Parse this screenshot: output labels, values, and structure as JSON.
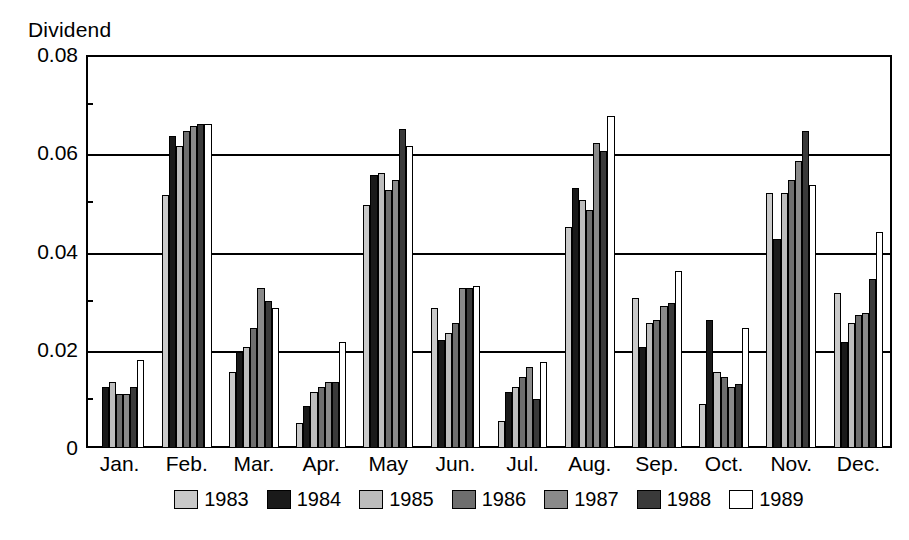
{
  "chart_data": {
    "type": "bar",
    "title": "",
    "ylabel": "Dividend",
    "xlabel": "",
    "ylim": [
      0,
      0.08
    ],
    "ytick_labels": [
      "0",
      "0.02",
      "0.04",
      "0.06",
      "0.08"
    ],
    "ytick_values": [
      0,
      0.02,
      0.04,
      0.06,
      0.08
    ],
    "yminor_values": [
      0.01,
      0.03,
      0.05,
      0.07
    ],
    "grid": true,
    "legend_position": "bottom",
    "categories": [
      "Jan.",
      "Feb.",
      "Mar.",
      "Apr.",
      "May",
      "Jun.",
      "Jul.",
      "Aug.",
      "Sep.",
      "Oct.",
      "Nov.",
      "Dec."
    ],
    "series": [
      {
        "name": "1983",
        "color": "#c9c9c9",
        "values": [
          0.0,
          0.0515,
          0.0155,
          0.005,
          0.0495,
          0.0285,
          0.0055,
          0.045,
          0.0305,
          0.009,
          0.052,
          0.0315
        ]
      },
      {
        "name": "1984",
        "color": "#1a1a1a",
        "values": [
          0.0125,
          0.0635,
          0.0195,
          0.0085,
          0.0555,
          0.022,
          0.0115,
          0.053,
          0.0205,
          0.026,
          0.0425,
          0.0215
        ]
      },
      {
        "name": "1985",
        "color": "#bdbdbd",
        "values": [
          0.0135,
          0.0615,
          0.0205,
          0.0115,
          0.056,
          0.0235,
          0.0125,
          0.0505,
          0.0255,
          0.0155,
          0.052,
          0.0255
        ]
      },
      {
        "name": "1986",
        "color": "#6e6e6e",
        "values": [
          0.011,
          0.0645,
          0.0245,
          0.0125,
          0.0525,
          0.0255,
          0.0145,
          0.0485,
          0.026,
          0.0145,
          0.0545,
          0.027
        ]
      },
      {
        "name": "1987",
        "color": "#8a8a8a",
        "values": [
          0.011,
          0.0655,
          0.0325,
          0.0135,
          0.0545,
          0.0325,
          0.0165,
          0.062,
          0.029,
          0.0125,
          0.0585,
          0.0275
        ]
      },
      {
        "name": "1988",
        "color": "#3a3a3a",
        "values": [
          0.0125,
          0.066,
          0.03,
          0.0135,
          0.065,
          0.0325,
          0.01,
          0.0605,
          0.0295,
          0.013,
          0.0645,
          0.0345
        ]
      },
      {
        "name": "1989",
        "color": "#ffffff",
        "values": [
          0.018,
          0.066,
          0.0285,
          0.0215,
          0.0615,
          0.033,
          0.0175,
          0.0675,
          0.036,
          0.0245,
          0.0535,
          0.044
        ]
      }
    ]
  },
  "legend": {
    "items": [
      {
        "label": "1983"
      },
      {
        "label": "1984"
      },
      {
        "label": "1985"
      },
      {
        "label": "1986"
      },
      {
        "label": "1987"
      },
      {
        "label": "1988"
      },
      {
        "label": "1989"
      }
    ]
  }
}
